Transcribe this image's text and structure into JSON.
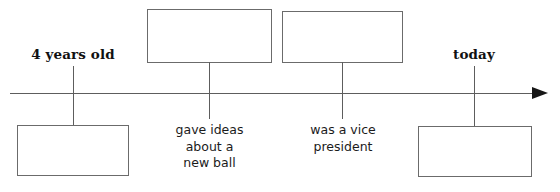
{
  "diagram": {
    "type": "timeline",
    "orientation": "horizontal",
    "direction": "left-to-right",
    "axis": {
      "name": "timeline-axis",
      "arrowhead": "right",
      "color": "#5d5d5d",
      "arrow_color": "#171717"
    },
    "events": [
      {
        "id": "event-1",
        "tick_x": 73,
        "label_position": "above",
        "label_text": "4 years old",
        "label_style": "bold-serif",
        "blank_position": "below",
        "blank_filled": false,
        "blank_text": ""
      },
      {
        "id": "event-2",
        "tick_x": 209,
        "label_position": "below",
        "label_text": "gave ideas\nabout a\nnew ball",
        "label_style": "regular-sans",
        "blank_position": "above",
        "blank_filled": false,
        "blank_text": ""
      },
      {
        "id": "event-3",
        "tick_x": 342,
        "label_position": "below",
        "label_text": "was a vice\npresident",
        "label_style": "regular-sans",
        "blank_position": "above",
        "blank_filled": false,
        "blank_text": ""
      },
      {
        "id": "event-4",
        "tick_x": 474,
        "label_position": "above",
        "label_text": "today",
        "label_style": "bold-serif",
        "blank_position": "below",
        "blank_filled": false,
        "blank_text": ""
      }
    ]
  },
  "colors": {
    "background": "#ffffff",
    "line": "#5d5d5d",
    "box_border": "#6b6b6b",
    "text": "#111111",
    "arrow": "#171717"
  }
}
